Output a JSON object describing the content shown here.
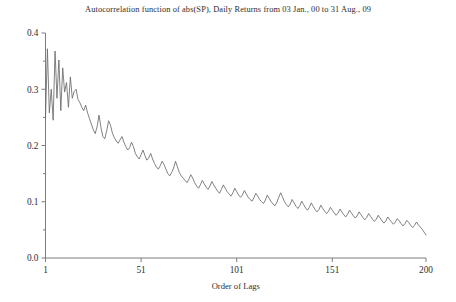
{
  "chart_data": {
    "type": "line",
    "title": "Autocorrelation function of abs(SP), Daily Returns from 03 Jan., 00 to 31 Aug., 09",
    "xlabel": "Order of Lags",
    "ylabel": "",
    "xlim": [
      1,
      200
    ],
    "ylim": [
      0.0,
      0.4
    ],
    "grid": false,
    "legend": null,
    "line_color": "#6a6a6a",
    "xticks": [
      1,
      51,
      101,
      151,
      200
    ],
    "xtick_labels": [
      "1",
      "51",
      "101",
      "151",
      "200"
    ],
    "yticks": [
      0.0,
      0.1,
      0.2,
      0.3,
      0.4
    ],
    "ytick_labels": [
      "0.0",
      "0.1",
      "0.2",
      "0.3",
      "0.4"
    ],
    "yticks_minor": [
      0.05,
      0.15,
      0.25,
      0.35
    ],
    "series": [
      {
        "name": "ACF of abs(SP) daily returns",
        "x": [
          1,
          2,
          3,
          4,
          5,
          6,
          7,
          8,
          9,
          10,
          11,
          12,
          13,
          14,
          15,
          16,
          17,
          18,
          19,
          20,
          21,
          22,
          23,
          24,
          25,
          26,
          27,
          28,
          29,
          30,
          31,
          32,
          33,
          34,
          35,
          36,
          37,
          38,
          39,
          40,
          41,
          42,
          43,
          44,
          45,
          46,
          47,
          48,
          49,
          50,
          51,
          52,
          53,
          54,
          55,
          56,
          57,
          58,
          59,
          60,
          61,
          62,
          63,
          64,
          65,
          66,
          67,
          68,
          69,
          70,
          71,
          72,
          73,
          74,
          75,
          76,
          77,
          78,
          79,
          80,
          81,
          82,
          83,
          84,
          85,
          86,
          87,
          88,
          89,
          90,
          91,
          92,
          93,
          94,
          95,
          96,
          97,
          98,
          99,
          100,
          101,
          102,
          103,
          104,
          105,
          106,
          107,
          108,
          109,
          110,
          111,
          112,
          113,
          114,
          115,
          116,
          117,
          118,
          119,
          120,
          121,
          122,
          123,
          124,
          125,
          126,
          127,
          128,
          129,
          130,
          131,
          132,
          133,
          134,
          135,
          136,
          137,
          138,
          139,
          140,
          141,
          142,
          143,
          144,
          145,
          146,
          147,
          148,
          149,
          150,
          151,
          152,
          153,
          154,
          155,
          156,
          157,
          158,
          159,
          160,
          161,
          162,
          163,
          164,
          165,
          166,
          167,
          168,
          169,
          170,
          171,
          172,
          173,
          174,
          175,
          176,
          177,
          178,
          179,
          180,
          181,
          182,
          183,
          184,
          185,
          186,
          187,
          188,
          189,
          190,
          191,
          192,
          193,
          194,
          195,
          196,
          197,
          198,
          199,
          200
        ],
        "y": [
          0.248,
          0.372,
          0.258,
          0.3,
          0.245,
          0.368,
          0.284,
          0.352,
          0.262,
          0.338,
          0.295,
          0.312,
          0.268,
          0.322,
          0.284,
          0.296,
          0.3,
          0.282,
          0.276,
          0.268,
          0.262,
          0.272,
          0.258,
          0.248,
          0.238,
          0.228,
          0.221,
          0.234,
          0.254,
          0.232,
          0.216,
          0.212,
          0.226,
          0.244,
          0.236,
          0.222,
          0.214,
          0.208,
          0.204,
          0.21,
          0.216,
          0.206,
          0.198,
          0.192,
          0.196,
          0.206,
          0.198,
          0.186,
          0.18,
          0.176,
          0.184,
          0.192,
          0.182,
          0.174,
          0.178,
          0.186,
          0.176,
          0.168,
          0.162,
          0.158,
          0.164,
          0.172,
          0.166,
          0.158,
          0.15,
          0.146,
          0.152,
          0.16,
          0.172,
          0.162,
          0.152,
          0.146,
          0.142,
          0.138,
          0.134,
          0.14,
          0.148,
          0.142,
          0.134,
          0.128,
          0.124,
          0.13,
          0.138,
          0.132,
          0.126,
          0.122,
          0.128,
          0.136,
          0.13,
          0.124,
          0.119,
          0.115,
          0.122,
          0.13,
          0.124,
          0.118,
          0.114,
          0.11,
          0.116,
          0.124,
          0.118,
          0.112,
          0.108,
          0.112,
          0.12,
          0.114,
          0.108,
          0.104,
          0.101,
          0.107,
          0.115,
          0.11,
          0.104,
          0.1,
          0.097,
          0.103,
          0.112,
          0.106,
          0.1,
          0.096,
          0.093,
          0.099,
          0.108,
          0.116,
          0.108,
          0.1,
          0.095,
          0.091,
          0.096,
          0.104,
          0.098,
          0.092,
          0.088,
          0.093,
          0.101,
          0.095,
          0.089,
          0.085,
          0.09,
          0.098,
          0.092,
          0.086,
          0.082,
          0.086,
          0.094,
          0.088,
          0.083,
          0.079,
          0.083,
          0.09,
          0.085,
          0.08,
          0.076,
          0.08,
          0.087,
          0.082,
          0.077,
          0.073,
          0.078,
          0.085,
          0.08,
          0.075,
          0.071,
          0.075,
          0.082,
          0.077,
          0.072,
          0.068,
          0.072,
          0.079,
          0.074,
          0.069,
          0.065,
          0.069,
          0.076,
          0.071,
          0.066,
          0.062,
          0.066,
          0.073,
          0.068,
          0.064,
          0.06,
          0.064,
          0.07,
          0.066,
          0.061,
          0.057,
          0.061,
          0.067,
          0.063,
          0.058,
          0.054,
          0.058,
          0.064,
          0.059,
          0.055,
          0.051,
          0.046,
          0.041
        ]
      }
    ]
  }
}
